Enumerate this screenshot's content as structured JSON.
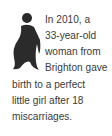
{
  "illustration": {
    "icon": "pregnant-woman-silhouette-icon",
    "color": "#2b2b2b"
  },
  "text": {
    "lines": [
      "In 2010, a",
      "33-year-old",
      "woman from",
      "Brighton gave",
      "birth to a perfect",
      "little girl after 18",
      "miscarriages."
    ]
  }
}
